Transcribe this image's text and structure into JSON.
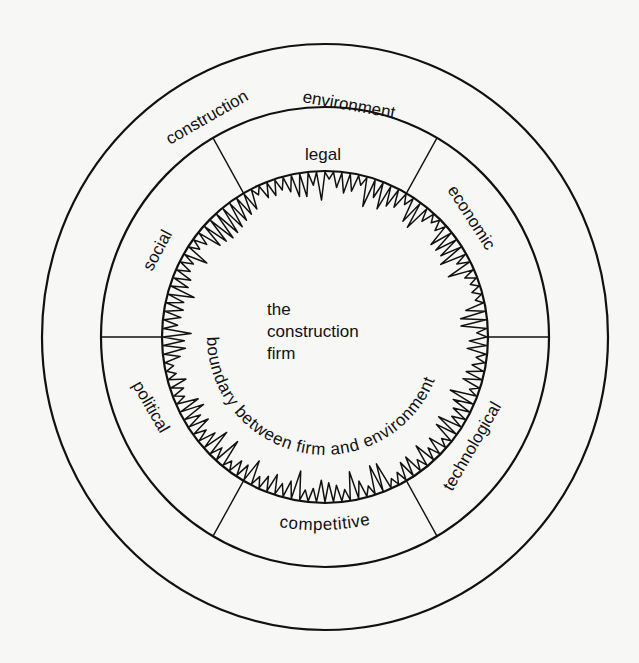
{
  "diagram": {
    "center_label": {
      "lines": [
        "the",
        "construction",
        "firm"
      ]
    },
    "boundary_label": "boundary between firm and environment",
    "outer_ring_label": {
      "word1": "construction",
      "word2": "environment"
    },
    "sectors": [
      {
        "id": "legal",
        "label": "legal"
      },
      {
        "id": "economic",
        "label": "economic"
      },
      {
        "id": "technological",
        "label": "technological"
      },
      {
        "id": "competitive",
        "label": "competitive"
      },
      {
        "id": "political",
        "label": "political"
      },
      {
        "id": "social",
        "label": "social"
      }
    ],
    "geometry": {
      "center": [
        325,
        337
      ],
      "outer_ring": {
        "rx": 283,
        "ry": 293
      },
      "middle_ring": {
        "rx": 224,
        "ry": 230
      },
      "inner_ring": {
        "rx": 163,
        "ry": 166
      },
      "divider_angles_deg": [
        0,
        60,
        120,
        180,
        240,
        300
      ]
    },
    "boundary_zigzag": {
      "spikes": 120,
      "min_depth": 8,
      "max_depth": 30,
      "seed": 7
    },
    "colors": {
      "ink": "#111111",
      "paper": "#f7f7f5"
    }
  }
}
